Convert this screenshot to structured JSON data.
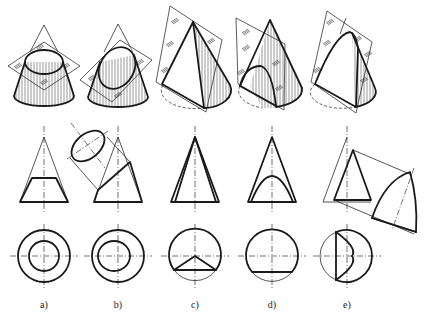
{
  "figure": {
    "panels": [
      {
        "id": "a",
        "label": "a)",
        "cx": 44,
        "section": "circle (plane perpendicular to axis)"
      },
      {
        "id": "b",
        "label": "b)",
        "cx": 118,
        "section": "ellipse (plane inclined to axis)"
      },
      {
        "id": "c",
        "label": "c)",
        "cx": 195,
        "section": "triangle (plane through apex)"
      },
      {
        "id": "d",
        "label": "d)",
        "cx": 272,
        "section": "hyperbola (plane parallel to axis)"
      },
      {
        "id": "e",
        "label": "e)",
        "cx": 347,
        "section": "parabola (plane parallel to a generatrix)"
      }
    ],
    "rows": {
      "pictorial_y": [
        5,
        115
      ],
      "front_view": {
        "apex_y": 137,
        "base_y": 202,
        "half_base": 24
      },
      "top_view": {
        "cy": 256,
        "r": 26
      },
      "label_y": 300
    },
    "colors": {
      "line": "#1a1a1a",
      "background": "#ffffff"
    }
  }
}
